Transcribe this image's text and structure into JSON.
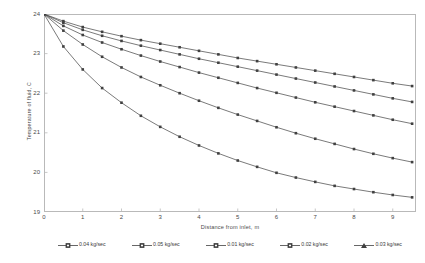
{
  "chart_data": {
    "type": "line",
    "title": "",
    "xlabel": "Distance from inlet, m",
    "ylabel": "Temperature of fluid, C",
    "xlim": [
      0,
      9.6
    ],
    "ylim": [
      19,
      24
    ],
    "xticks": [
      0,
      1,
      2,
      3,
      4,
      5,
      6,
      7,
      8,
      9
    ],
    "yticks": [
      19,
      20,
      21,
      22,
      23,
      24
    ],
    "grid": false,
    "legend_position": "bottom",
    "marker": "square",
    "line_color": "#404040",
    "x": [
      0,
      0.5,
      1,
      1.5,
      2,
      2.5,
      3,
      3.5,
      4,
      4.5,
      5,
      5.5,
      6,
      6.5,
      7,
      7.5,
      8,
      8.5,
      9,
      9.5
    ],
    "series": [
      {
        "name": "0.04 kg/sec",
        "legend_label": "0.04 kg/sec",
        "values": [
          24.0,
          23.78,
          23.6,
          23.45,
          23.32,
          23.2,
          23.09,
          22.98,
          22.87,
          22.77,
          22.67,
          22.57,
          22.47,
          22.37,
          22.27,
          22.17,
          22.07,
          21.97,
          21.87,
          21.78
        ]
      },
      {
        "name": "0.05 kg/sec",
        "legend_label": "0.05 kg/sec",
        "values": [
          24.0,
          23.82,
          23.67,
          23.55,
          23.44,
          23.34,
          23.25,
          23.16,
          23.07,
          22.98,
          22.89,
          22.81,
          22.73,
          22.65,
          22.57,
          22.49,
          22.41,
          22.33,
          22.25,
          22.18
        ]
      },
      {
        "name": "0.01 kg/sec",
        "legend_label": "0.01 kg/sec",
        "values": [
          24.0,
          23.18,
          22.6,
          22.13,
          21.76,
          21.43,
          21.15,
          20.9,
          20.68,
          20.48,
          20.3,
          20.14,
          19.99,
          19.87,
          19.76,
          19.66,
          19.58,
          19.5,
          19.43,
          19.37
        ]
      },
      {
        "name": "0.02 kg/sec",
        "legend_label": "0.02 kg/sec",
        "values": [
          24.0,
          23.58,
          23.23,
          22.92,
          22.65,
          22.41,
          22.2,
          22.0,
          21.81,
          21.63,
          21.46,
          21.3,
          21.14,
          20.99,
          20.85,
          20.72,
          20.59,
          20.47,
          20.36,
          20.26
        ]
      },
      {
        "name": "0.03 kg/sec",
        "legend_label": "0.03 kg/sec",
        "values": [
          24.0,
          23.7,
          23.47,
          23.28,
          23.11,
          22.95,
          22.8,
          22.66,
          22.52,
          22.39,
          22.26,
          22.13,
          22.01,
          21.89,
          21.77,
          21.66,
          21.55,
          21.44,
          21.33,
          21.23
        ]
      }
    ]
  },
  "axes": {
    "y_title": "Temperature of fluid, C",
    "x_title": "Distance from inlet, m",
    "y_tick_labels": [
      "24",
      "23",
      "22",
      "21",
      "20",
      "19"
    ],
    "x_tick_labels": [
      "0",
      "1",
      "2",
      "3",
      "4",
      "5",
      "6",
      "7",
      "8",
      "9"
    ]
  },
  "legend": {
    "items": [
      {
        "label": "0.04 kg/sec",
        "marker": "square-dot"
      },
      {
        "label": "0.05 kg/sec",
        "marker": "square-dot"
      },
      {
        "label": "0.01 kg/sec",
        "marker": "square-dot"
      },
      {
        "label": "0.02 kg/sec",
        "marker": "square-dot"
      },
      {
        "label": "0.03 kg/sec",
        "marker": "triangle-dot"
      }
    ]
  },
  "colors": {
    "line": "#404040",
    "frame": "#b9b9b9",
    "text": "#4a4a4a",
    "background": "#ffffff"
  }
}
